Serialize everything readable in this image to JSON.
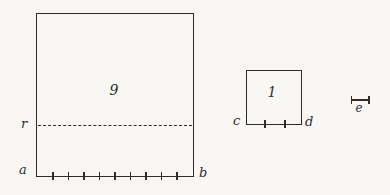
{
  "figure": {
    "paper_color": "#f8f7f3",
    "ink_color": "#2e2d2b",
    "large_square": {
      "area_label": "9",
      "bottom_left_label": "a",
      "bottom_right_label": "b",
      "left_point_label": "r",
      "bottom_tick_count": 9,
      "has_dashed_line_at_r": true
    },
    "small_square": {
      "area_label": "1",
      "bottom_left_label": "c",
      "bottom_right_label": "d",
      "bottom_tick_count": 2
    },
    "unit_segment": {
      "label": "e"
    }
  }
}
